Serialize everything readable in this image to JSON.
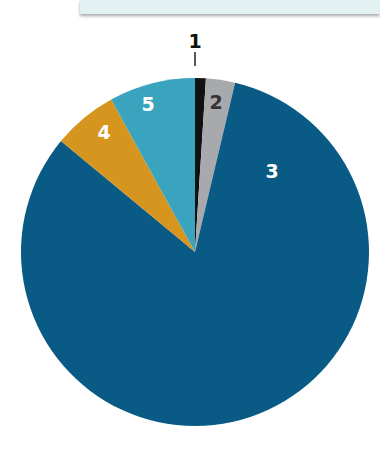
{
  "chart_data": {
    "type": "pie",
    "title": "",
    "categories": [
      "1",
      "2",
      "3",
      "4",
      "5"
    ],
    "values": [
      1.0,
      2.7,
      82.3,
      6.0,
      8.0
    ],
    "colors": [
      "#111111",
      "#a8a9ad",
      "#0a5a86",
      "#d6951f",
      "#3aa3bd"
    ],
    "label_colors": [
      "#111111",
      "#333333",
      "#ffffff",
      "#ffffff",
      "#ffffff"
    ],
    "start_angle_deg": 0,
    "direction": "clockwise",
    "legend": "none",
    "labels_on_slices": true
  },
  "labels": {
    "s1": "1",
    "s2": "2",
    "s3": "3",
    "s4": "4",
    "s5": "5"
  }
}
